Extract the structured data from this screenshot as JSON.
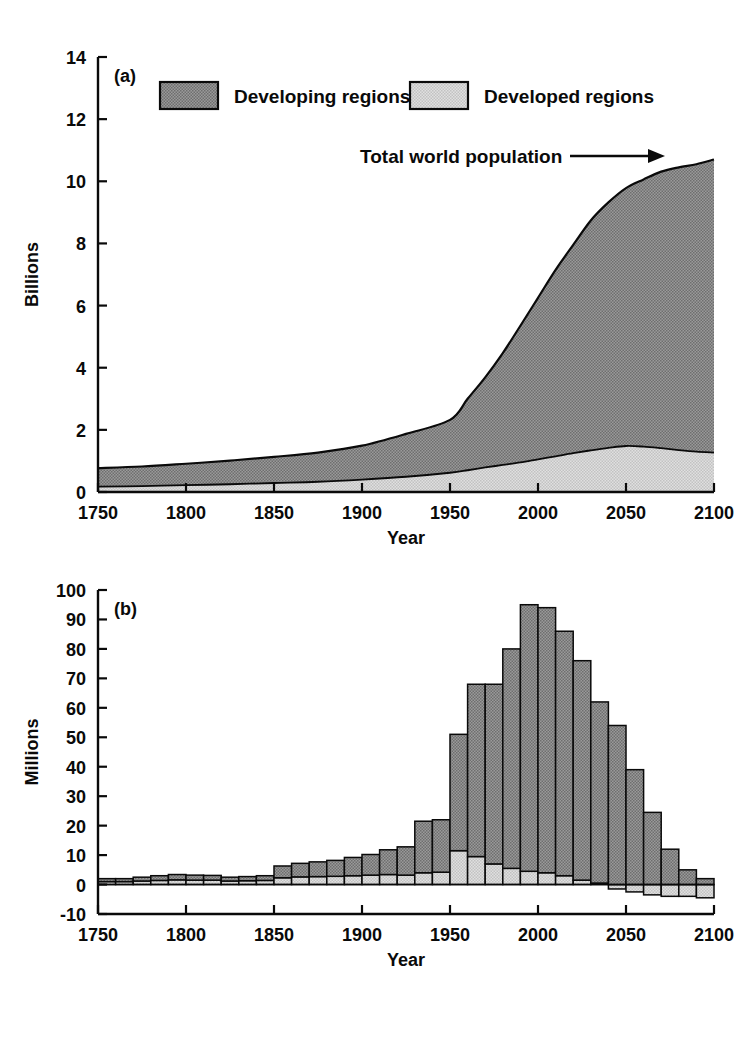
{
  "figure": {
    "background": "#ffffff",
    "ink": "#0a0a0a",
    "colors": {
      "developing_fill": "#8a8a8a",
      "developed_fill": "#d2d2d2",
      "outline": "#0a0a0a"
    }
  },
  "legend": {
    "position": "top-left-inside-panel-a",
    "entries": [
      {
        "label": "Developing regions",
        "swatch": "#8a8a8a",
        "name": "legend-swatch-developing"
      },
      {
        "label": "Developed regions",
        "swatch": "#d2d2d2",
        "name": "legend-swatch-developed"
      }
    ]
  },
  "annotations": {
    "total_world_population": "Total world population",
    "arrow": "right-arrow"
  },
  "panel_labels": {
    "a": "(a)",
    "b": "(b)"
  },
  "chart_data": [
    {
      "id": "panel-a",
      "type": "area",
      "stacked": true,
      "title": "",
      "panel_label": "(a)",
      "xlabel": "Year",
      "ylabel": "Billions",
      "xlim": [
        1750,
        2100
      ],
      "ylim": [
        0,
        14
      ],
      "xticks": [
        1750,
        1800,
        1850,
        1900,
        1950,
        2000,
        2050,
        2100
      ],
      "xticklabels": [
        "1750",
        "1800",
        "1850",
        "1900",
        "1950",
        "2000",
        "2050",
        "2100"
      ],
      "yticks": [
        0,
        2,
        4,
        6,
        8,
        10,
        12,
        14
      ],
      "yticklabels": [
        "0",
        "2",
        "4",
        "6",
        "8",
        "10",
        "12",
        "14"
      ],
      "grid": false,
      "legend_entries": [
        "Developing regions",
        "Developed regions"
      ],
      "annotation": "Total world population",
      "x": [
        1750,
        1775,
        1800,
        1825,
        1850,
        1875,
        1900,
        1925,
        1950,
        1960,
        1970,
        1980,
        1990,
        2000,
        2010,
        2020,
        2030,
        2040,
        2050,
        2060,
        2070,
        2080,
        2090,
        2100
      ],
      "series": [
        {
          "name": "Developed regions",
          "values": [
            0.17,
            0.19,
            0.22,
            0.25,
            0.29,
            0.33,
            0.4,
            0.49,
            0.62,
            0.7,
            0.79,
            0.87,
            0.95,
            1.05,
            1.15,
            1.25,
            1.34,
            1.42,
            1.48,
            1.46,
            1.41,
            1.35,
            1.3,
            1.27
          ]
        },
        {
          "name": "Developing regions",
          "values": [
            0.6,
            0.63,
            0.69,
            0.76,
            0.84,
            0.94,
            1.09,
            1.38,
            1.7,
            2.3,
            2.9,
            3.6,
            4.4,
            5.2,
            6.0,
            6.7,
            7.4,
            7.9,
            8.3,
            8.6,
            8.9,
            9.1,
            9.25,
            9.43
          ]
        }
      ],
      "total": {
        "name": "Total world population",
        "values": [
          0.77,
          0.82,
          0.91,
          1.01,
          1.13,
          1.27,
          1.49,
          1.87,
          2.32,
          3.0,
          3.69,
          4.47,
          5.35,
          6.25,
          7.15,
          7.95,
          8.74,
          9.32,
          9.78,
          10.06,
          10.31,
          10.45,
          10.55,
          10.7
        ]
      }
    },
    {
      "id": "panel-b",
      "type": "bar",
      "stacked": true,
      "title": "",
      "panel_label": "(b)",
      "xlabel": "Year",
      "ylabel": "Millions",
      "xlim": [
        1750,
        2100
      ],
      "ylim": [
        -10,
        100
      ],
      "xticks": [
        1750,
        1800,
        1850,
        1900,
        1950,
        2000,
        2050,
        2100
      ],
      "xticklabels": [
        "1750",
        "1800",
        "1850",
        "1900",
        "1950",
        "2000",
        "2050",
        "2100"
      ],
      "yticks": [
        -10,
        0,
        10,
        20,
        30,
        40,
        50,
        60,
        70,
        80,
        90,
        100
      ],
      "yticklabels": [
        "-10",
        "0",
        "10",
        "20",
        "30",
        "40",
        "50",
        "60",
        "70",
        "80",
        "90",
        "100"
      ],
      "grid": false,
      "bar_width_years": 10,
      "categories": [
        1750,
        1760,
        1770,
        1780,
        1790,
        1800,
        1810,
        1820,
        1830,
        1840,
        1850,
        1860,
        1870,
        1880,
        1890,
        1900,
        1910,
        1920,
        1930,
        1940,
        1950,
        1960,
        1970,
        1980,
        1990,
        2000,
        2010,
        2020,
        2030,
        2040,
        2050,
        2060,
        2070,
        2080,
        2090
      ],
      "series": [
        {
          "name": "Developed regions",
          "values": [
            1.0,
            1.0,
            1.2,
            1.4,
            1.6,
            1.5,
            1.5,
            1.2,
            1.3,
            1.4,
            2.3,
            2.6,
            2.7,
            2.8,
            3.0,
            3.2,
            3.4,
            3.2,
            4.0,
            4.2,
            11.5,
            9.5,
            7.0,
            5.5,
            4.5,
            4.0,
            3.0,
            1.5,
            0.5,
            -1.5,
            -2.5,
            -3.5,
            -4.0,
            -4.0,
            -4.5
          ]
        },
        {
          "name": "Developing regions",
          "values": [
            1.0,
            1.0,
            1.3,
            1.6,
            1.8,
            1.7,
            1.6,
            1.3,
            1.4,
            1.6,
            4.0,
            4.6,
            5.0,
            5.4,
            6.2,
            7.0,
            8.4,
            9.6,
            17.5,
            17.8,
            39.5,
            58.5,
            61.0,
            74.5,
            90.5,
            90.0,
            83.0,
            74.5,
            61.5,
            54.0,
            39.0,
            24.5,
            12.0,
            5.0,
            2.0
          ]
        }
      ],
      "totals": [
        2.0,
        2.0,
        2.5,
        3.0,
        3.4,
        3.2,
        3.1,
        2.5,
        2.7,
        3.0,
        6.3,
        7.2,
        7.7,
        8.2,
        9.2,
        10.2,
        11.8,
        12.8,
        21.5,
        22.0,
        51.0,
        68.0,
        68.0,
        80.0,
        95.0,
        94.0,
        86.0,
        76.0,
        62.0,
        52.5,
        36.5,
        21.0,
        8.0,
        1.0,
        -2.5
      ]
    }
  ]
}
